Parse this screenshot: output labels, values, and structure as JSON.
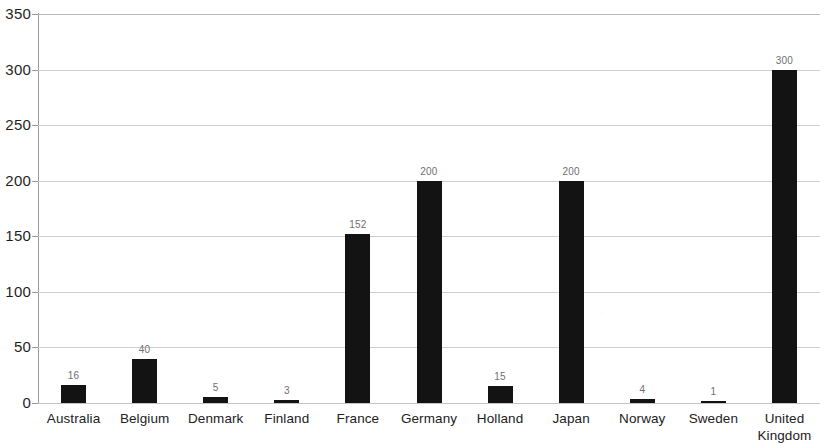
{
  "chart_data": {
    "type": "bar",
    "title": "",
    "subtitle": "",
    "xlabel": "",
    "ylabel": "",
    "categories": [
      "Australia",
      "Belgium",
      "Denmark",
      "Finland",
      "France",
      "Germany",
      "Holland",
      "Japan",
      "Norway",
      "Sweden",
      "United\nKingdom"
    ],
    "values": [
      16,
      40,
      5,
      3,
      152,
      200,
      15,
      200,
      4,
      1,
      300
    ],
    "data_labels": [
      "16",
      "40",
      "5",
      "3",
      "152",
      "200",
      "15",
      "200",
      "4",
      "1",
      "300"
    ],
    "ylim": [
      0,
      350
    ],
    "ytick_labels": [
      "0",
      "50",
      "100",
      "150",
      "200",
      "250",
      "300",
      "350"
    ],
    "ytick_values": [
      0,
      50,
      100,
      150,
      200,
      250,
      300,
      350
    ],
    "grid": "horizontal",
    "legend": "none",
    "series_color": "#131313",
    "gridline_color": "#b8b8b8",
    "axis_color": "#9a9a9a",
    "background_color": "#ffffff",
    "data_label_color": "#6f6f6f"
  }
}
